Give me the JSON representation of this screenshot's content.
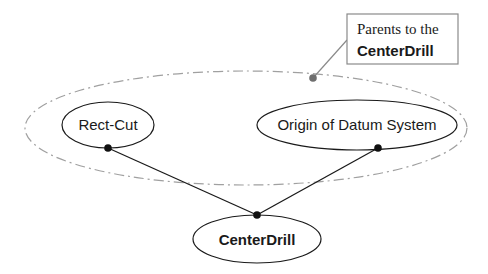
{
  "diagram": {
    "callout": {
      "line1": "Parents to the",
      "line2": "CenterDrill"
    },
    "nodes": [
      {
        "id": "rect-cut",
        "label": "Rect-Cut",
        "bold": false
      },
      {
        "id": "origin-of-datum-system",
        "label": "Origin of Datum System",
        "bold": false
      },
      {
        "id": "centerdrill",
        "label": "CenterDrill",
        "bold": true
      }
    ],
    "edges": [
      {
        "from": "rect-cut",
        "to": "centerdrill"
      },
      {
        "from": "origin-of-datum-system",
        "to": "centerdrill"
      }
    ],
    "group": {
      "label": "Parents to the CenterDrill",
      "members": [
        "rect-cut",
        "origin-of-datum-system"
      ]
    },
    "colors": {
      "stroke": "#1a1a1a",
      "group_stroke": "#9a9a9a",
      "callout_border": "#8a8a8a",
      "dot": "#111111",
      "group_dot": "#6e6e6e"
    }
  }
}
